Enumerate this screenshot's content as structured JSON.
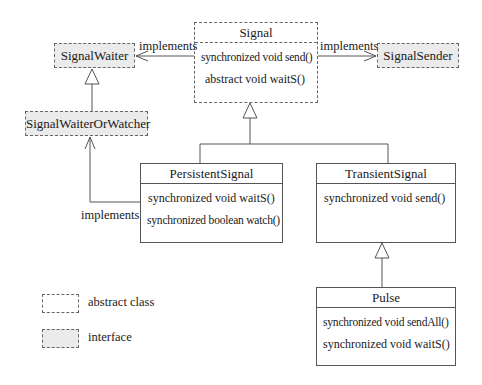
{
  "diagram": {
    "type": "uml-class-diagram",
    "classes": {
      "signal": {
        "name": "Signal",
        "kind": "abstract class",
        "ops": [
          "synchronized void send()",
          "abstract void waitS()"
        ]
      },
      "persistent": {
        "name": "PersistentSignal",
        "kind": "class",
        "ops": [
          "synchronized void waitS()",
          "synchronized boolean watch()"
        ]
      },
      "transient": {
        "name": "TransientSignal",
        "kind": "class",
        "ops": [
          "synchronized void send()"
        ]
      },
      "pulse": {
        "name": "Pulse",
        "kind": "class",
        "ops": [
          "synchronized void sendAll()",
          "synchronized void waitS()"
        ]
      }
    },
    "interfaces": {
      "waiter": {
        "name": "SignalWaiter"
      },
      "waiterOrWatcher": {
        "name": "SignalWaiterOrWatcher"
      },
      "sender": {
        "name": "SignalSender"
      }
    },
    "relations": {
      "signal_waiter": {
        "from": "Signal",
        "to": "SignalWaiter",
        "label": "implements"
      },
      "signal_sender": {
        "from": "Signal",
        "to": "SignalSender",
        "label": "implements"
      },
      "persistent_wow": {
        "from": "PersistentSignal",
        "to": "SignalWaiterOrWatcher",
        "label": "implements"
      },
      "wow_waiter": {
        "from": "SignalWaiterOrWatcher",
        "to": "SignalWaiter",
        "type": "extends"
      },
      "persistent_signal": {
        "from": "PersistentSignal",
        "to": "Signal",
        "type": "extends"
      },
      "transient_signal": {
        "from": "TransientSignal",
        "to": "Signal",
        "type": "extends"
      },
      "pulse_transient": {
        "from": "Pulse",
        "to": "TransientSignal",
        "type": "extends"
      }
    },
    "legend": {
      "abstract": "abstract class",
      "interface": "interface"
    },
    "colors": {
      "line": "#555555",
      "interface_fill": "#ebebeb",
      "background": "#ffffff"
    }
  }
}
